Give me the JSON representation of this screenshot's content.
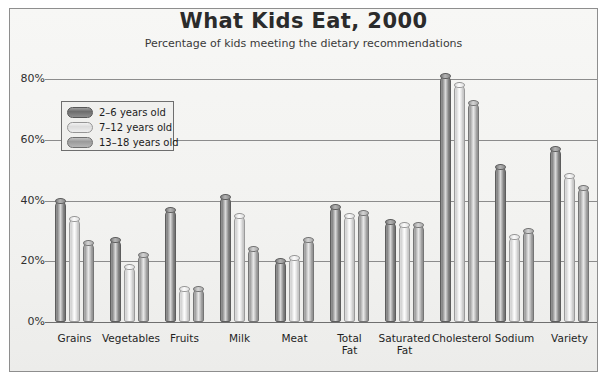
{
  "chart_data": {
    "type": "bar",
    "title": "What Kids Eat, 2000",
    "subtitle": "Percentage of kids meeting the dietary recommendations",
    "xlabel": "",
    "ylabel": "",
    "ylim": [
      0,
      85
    ],
    "yticks": [
      0,
      20,
      40,
      60,
      80
    ],
    "ytick_labels": [
      "0%",
      "20%",
      "40%",
      "60%",
      "80%"
    ],
    "grid": true,
    "legend_position": "upper-left-inside",
    "categories": [
      "Grains",
      "Vegetables",
      "Fruits",
      "Milk",
      "Meat",
      "Total\nFat",
      "Saturated\nFat",
      "Cholesterol",
      "Sodium",
      "Variety"
    ],
    "category_labels": [
      {
        "line1": "Grains",
        "line2": ""
      },
      {
        "line1": "Vegetables",
        "line2": ""
      },
      {
        "line1": "Fruits",
        "line2": ""
      },
      {
        "line1": "Milk",
        "line2": ""
      },
      {
        "line1": "Meat",
        "line2": ""
      },
      {
        "line1": "Total",
        "line2": "Fat"
      },
      {
        "line1": "Saturated",
        "line2": "Fat"
      },
      {
        "line1": "Cholesterol",
        "line2": ""
      },
      {
        "line1": "Sodium",
        "line2": ""
      },
      {
        "line1": "Variety",
        "line2": ""
      }
    ],
    "series": [
      {
        "name": "2–6 years old",
        "values": [
          40,
          27,
          37,
          41,
          20,
          38,
          33,
          81,
          51,
          57
        ]
      },
      {
        "name": "7–12 years old",
        "values": [
          34,
          18,
          11,
          35,
          21,
          35,
          32,
          78,
          28,
          48
        ]
      },
      {
        "name": "13–18 years old",
        "values": [
          26,
          22,
          11,
          24,
          27,
          36,
          32,
          72,
          30,
          44
        ]
      }
    ]
  },
  "legend": {
    "items": [
      {
        "label": "2–6 years old"
      },
      {
        "label": "7–12 years old"
      },
      {
        "label": "13–18 years old"
      }
    ]
  },
  "colors": {
    "series_0": "#8a8a8a",
    "series_1": "#e6e6e6",
    "series_2": "#b4b4b4",
    "gridline": "#8c8c8c",
    "frame": "#8e8e8e",
    "plot_background": "#f4f4f2",
    "text": "#2b2b2b"
  }
}
